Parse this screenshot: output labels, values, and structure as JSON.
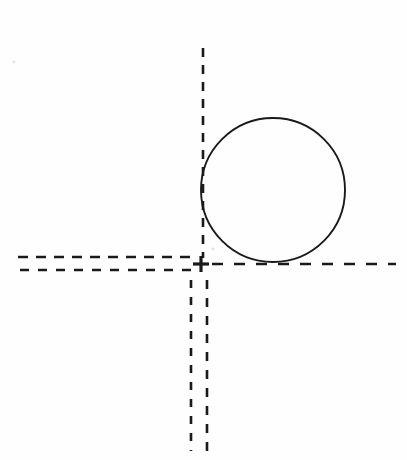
{
  "figure": {
    "canvas": {
      "width": 407,
      "height": 460
    },
    "background_color": "#fefefe",
    "ink_color": "#1a1a1a",
    "stroke_width_solid": 1.9,
    "stroke_width_dashed": 2.6
  },
  "chart_data": {
    "type": "diagram",
    "title": "",
    "xlabel": "",
    "ylabel": "",
    "coordinate_note": "pixel coordinates, origin top-left of 407x460 canvas",
    "origin_marker": {
      "x": 201,
      "y": 264,
      "label": "+",
      "size": 16
    },
    "circle": {
      "name": "tangent-circle",
      "cx": 273,
      "cy": 190,
      "r": 72,
      "left": 201,
      "right": 345,
      "top": 118,
      "bottom": 262,
      "fill": "none",
      "stroke": "#1a1a1a",
      "style": "solid"
    },
    "lines": [
      {
        "name": "vertical-tangent-upper",
        "orientation": "vertical",
        "x1": 203,
        "y1": 48,
        "x2": 203,
        "y2": 258,
        "style": "dashed",
        "dash": "9 8",
        "stroke": "#1a1a1a"
      },
      {
        "name": "horizontal-tangent-right",
        "orientation": "horizontal",
        "x1": 212,
        "y1": 264,
        "x2": 396,
        "y2": 264,
        "style": "dashed",
        "dash": "11 11",
        "stroke": "#1a1a1a"
      },
      {
        "name": "horizontal-left-upper",
        "orientation": "horizontal",
        "x1": 18,
        "y1": 257,
        "x2": 193,
        "y2": 257,
        "style": "dashed",
        "dash": "10 8",
        "stroke": "#1a1a1a"
      },
      {
        "name": "horizontal-left-lower",
        "orientation": "horizontal",
        "x1": 20,
        "y1": 270,
        "x2": 193,
        "y2": 270,
        "style": "dashed",
        "dash": "9 9",
        "stroke": "#1a1a1a"
      },
      {
        "name": "vertical-lower-left",
        "orientation": "vertical",
        "x1": 191,
        "y1": 280,
        "x2": 191,
        "y2": 451,
        "style": "dashed",
        "dash": "8 9",
        "stroke": "#1a1a1a"
      },
      {
        "name": "vertical-lower-right",
        "orientation": "vertical",
        "x1": 207,
        "y1": 280,
        "x2": 207,
        "y2": 451,
        "style": "dashed",
        "dash": "9 9",
        "stroke": "#1a1a1a"
      }
    ],
    "specks": [
      {
        "x": 14,
        "y": 62,
        "name": "paper-speck-upper-left"
      },
      {
        "x": 213,
        "y": 249,
        "name": "paper-speck-near-origin"
      }
    ],
    "annotations": [],
    "legend": null,
    "grid": false
  }
}
